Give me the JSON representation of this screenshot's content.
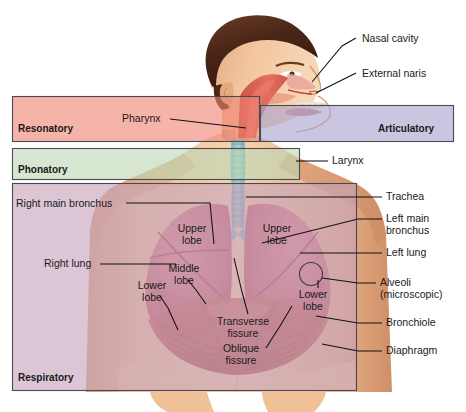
{
  "figure": {
    "width": 466,
    "height": 412
  },
  "zones": [
    {
      "id": "resonatory",
      "label": "Resonatory",
      "color": "#ef8475",
      "border": "#4a4a52",
      "x": 12,
      "y": 96,
      "w": 248,
      "h": 46
    },
    {
      "id": "articulatory",
      "label": "Articulatory",
      "color": "#a9a2cd",
      "border": "#4a4a52",
      "x": 260,
      "y": 105,
      "w": 194,
      "h": 37
    },
    {
      "id": "phonatory",
      "label": "Phonatory",
      "color": "#bdd6b4",
      "border": "#4a4a52",
      "x": 12,
      "y": 148,
      "w": 288,
      "h": 32
    },
    {
      "id": "respiratory",
      "label": "Respiratory",
      "color": "#c6a3bc",
      "border": "#4a4a52",
      "x": 12,
      "y": 183,
      "w": 345,
      "h": 208
    }
  ],
  "callouts": [
    {
      "id": "nasal-cavity",
      "text": "Nasal cavity",
      "x": 362,
      "y": 33,
      "align": "left"
    },
    {
      "id": "external-naris",
      "text": "External naris",
      "x": 362,
      "y": 68,
      "align": "left"
    },
    {
      "id": "pharynx",
      "text": "Pharynx",
      "x": 122,
      "y": 115,
      "align": "left"
    },
    {
      "id": "larynx",
      "text": "Larynx",
      "x": 332,
      "y": 158,
      "align": "left"
    },
    {
      "id": "trachea",
      "text": "Trachea",
      "x": 386,
      "y": 194,
      "align": "left"
    },
    {
      "id": "left-main-bronchus",
      "text": "Left main\nbronchus",
      "x": 386,
      "y": 214,
      "align": "left"
    },
    {
      "id": "left-lung",
      "text": "Left lung",
      "x": 386,
      "y": 250,
      "align": "left"
    },
    {
      "id": "alveoli",
      "text": "Alveoli\n(microscopic)",
      "x": 380,
      "y": 280,
      "align": "left"
    },
    {
      "id": "bronchiole",
      "text": "Bronchiole",
      "x": 386,
      "y": 320,
      "align": "left"
    },
    {
      "id": "diaphragm",
      "text": "Diaphragm",
      "x": 386,
      "y": 348,
      "align": "left"
    },
    {
      "id": "right-main-bronchus",
      "text": "Right main bronchus",
      "x": 16,
      "y": 200,
      "align": "left"
    },
    {
      "id": "right-lung",
      "text": "Right lung",
      "x": 44,
      "y": 261,
      "align": "left"
    },
    {
      "id": "upper-lobe-right",
      "text": "Upper\nlobe",
      "x": 192,
      "y": 228,
      "align": "center"
    },
    {
      "id": "upper-lobe-left",
      "text": "Upper\nlobe",
      "x": 277,
      "y": 228,
      "align": "center"
    },
    {
      "id": "middle-lobe",
      "text": "Middle\nlobe",
      "x": 184,
      "y": 268,
      "align": "center"
    },
    {
      "id": "lower-lobe-right",
      "text": "Lower\nlobe",
      "x": 152,
      "y": 285,
      "align": "center"
    },
    {
      "id": "lower-lobe-left",
      "text": "Lower\nlobe",
      "x": 313,
      "y": 294,
      "align": "center"
    },
    {
      "id": "transverse-fissure",
      "text": "Transverse\nfissure",
      "x": 243,
      "y": 321,
      "align": "center"
    },
    {
      "id": "oblique-fissure",
      "text": "Oblique\nfissure",
      "x": 241,
      "y": 348,
      "align": "center"
    }
  ],
  "anatomy": {
    "skin": "#e9b98f",
    "skin_shadow": "#cf9a74",
    "hair": "#5a3220",
    "lung_tissue": "#d1737a",
    "lung_tissue_dark": "#b8545e",
    "trachea": "#8fbfc4",
    "pharynx_red": "#d9544a",
    "diaphragm": "#c05a52",
    "background": "#ffffff"
  }
}
